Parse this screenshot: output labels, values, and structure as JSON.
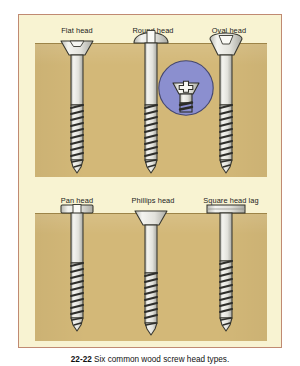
{
  "figure": {
    "caption_number": "22-22",
    "caption_text": "Six common wood screw head types.",
    "frame_border_color": "#c08a72",
    "panel_color": "#f8f3d2",
    "page_background": "#ffffff"
  },
  "materials": {
    "wood_color": "#d3b878",
    "wood_edge_color": "#9d8448",
    "metal_light": "#f2f2ee",
    "metal_mid": "#cfcfc8",
    "metal_dark": "#3a3a38",
    "inset_circle_color": "#8b8fcf"
  },
  "rows": [
    {
      "row_name": "top-row",
      "wood_block": {
        "name": "wood-block-top"
      },
      "screws": [
        {
          "id": "flat-head",
          "label": "Flat head",
          "head_style": "countersunk-flat",
          "drive": "slotted",
          "seating": "flush-with-surface",
          "label_x": 58,
          "label_y": 16,
          "screw_x": 42,
          "screw_y": 18
        },
        {
          "id": "round-head",
          "label": "Round head",
          "head_style": "domed-round",
          "drive": "slotted",
          "seating": "above-surface",
          "label_x": 132,
          "label_y": 16,
          "screw_x": 116,
          "screw_y": 18
        },
        {
          "id": "oval-head",
          "label": "Oval head",
          "head_style": "countersunk-oval",
          "drive": "slotted",
          "seating": "partly-flush",
          "label_x": 208,
          "label_y": 16,
          "screw_x": 192,
          "screw_y": 18
        }
      ]
    },
    {
      "row_name": "bottom-row",
      "wood_block": {
        "name": "wood-block-bottom"
      },
      "screws": [
        {
          "id": "pan-head",
          "label": "Pan head",
          "head_style": "pan-cylindrical",
          "drive": "slotted",
          "seating": "above-surface",
          "label_x": 58,
          "label_y": 186,
          "screw_x": 42,
          "screw_y": 188
        },
        {
          "id": "phillips-head",
          "label": "Phillips head",
          "head_style": "countersunk-flat",
          "drive": "phillips-cross",
          "seating": "flush-with-surface",
          "label_x": 132,
          "label_y": 186,
          "screw_x": 116,
          "screw_y": 188
        },
        {
          "id": "square-head-lag",
          "label": "Square head lag",
          "head_style": "square-hex-lag",
          "drive": "wrench-driven",
          "seating": "above-surface",
          "label_x": 210,
          "label_y": 186,
          "screw_x": 192,
          "screw_y": 188
        }
      ]
    }
  ],
  "inset": {
    "id": "phillips-magnifier",
    "depicts": "phillips-head-cross-recess-detail",
    "shape": "circle",
    "color": "#8b8fcf"
  }
}
